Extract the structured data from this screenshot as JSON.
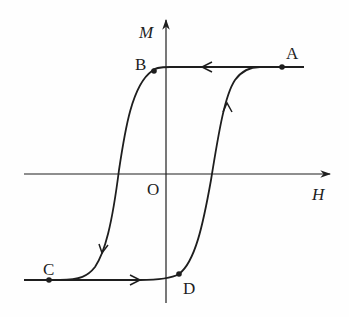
{
  "diagram": {
    "type": "hysteresis-loop",
    "axes": {
      "x_label": "H",
      "y_label": "M",
      "origin_label": "O"
    },
    "points": [
      {
        "id": "A",
        "label": "A",
        "description": "positive saturation on upper branch"
      },
      {
        "id": "B",
        "label": "B",
        "description": "upper branch near M axis (remanence region)"
      },
      {
        "id": "C",
        "label": "C",
        "description": "negative saturation on lower branch"
      },
      {
        "id": "D",
        "label": "D",
        "description": "lower branch just right of M axis"
      }
    ],
    "branches": [
      {
        "name": "upper-descending",
        "path": "A → B → C",
        "arrow_direction": "leftward along top, downward on left curve"
      },
      {
        "name": "lower-ascending",
        "path": "C → D → A",
        "arrow_direction": "rightward along bottom, upward on right curve"
      }
    ],
    "colors": {
      "line": "#1e1e1e",
      "background": "#fefefe"
    }
  }
}
